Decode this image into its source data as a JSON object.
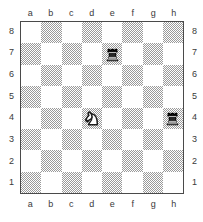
{
  "diagram": {
    "kind": "chess-board-diagram",
    "orientation": "white-bottom",
    "board_size": 8
  },
  "labels": {
    "files": [
      "a",
      "b",
      "c",
      "d",
      "e",
      "f",
      "g",
      "h"
    ],
    "ranks": [
      "8",
      "7",
      "6",
      "5",
      "4",
      "3",
      "2",
      "1"
    ]
  },
  "colors": {
    "light_square": "#ffffff",
    "dark_square": "#9a9a9a",
    "border": "#4a4a4a",
    "label_text": "#3a3a3a",
    "black_piece": "#262626",
    "white_piece": "#ffffff"
  },
  "chart_data": {
    "type": "table",
    "xlabel": "file",
    "ylabel": "rank",
    "categories": [
      "a",
      "b",
      "c",
      "d",
      "e",
      "f",
      "g",
      "h"
    ],
    "rows": [
      "8",
      "7",
      "6",
      "5",
      "4",
      "3",
      "2",
      "1"
    ],
    "pieces": [
      {
        "square": "e7",
        "file": "e",
        "rank": "7",
        "color": "black",
        "type": "rook",
        "symbol": "♜"
      },
      {
        "square": "d4",
        "file": "d",
        "rank": "4",
        "color": "white",
        "type": "knight",
        "symbol": "♘"
      },
      {
        "square": "h4",
        "file": "h",
        "rank": "4",
        "color": "black",
        "type": "rook",
        "symbol": "♜"
      }
    ],
    "piece_count": 3,
    "fen_placement": "8/4r3/8/8/3N3r/8/8/8"
  }
}
